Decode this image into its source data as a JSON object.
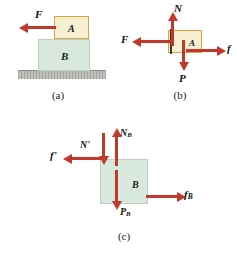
{
  "figure": {
    "background_color": "#ffffff",
    "arrow_color": "#c0392b",
    "block_a_fill": "#f6efd2",
    "block_a_border": "#d9a441",
    "block_b_fill": "#d8e8dc",
    "block_b_border": "#b9cfc0",
    "ground_color": "#b4b4b0"
  },
  "panels": [
    {
      "id": "a",
      "caption": "(a)",
      "blocks": [
        {
          "name": "block-a",
          "label": "A"
        },
        {
          "name": "block-b",
          "label": "B"
        }
      ],
      "forces": [
        {
          "name": "force-F",
          "label": "F",
          "direction": "left"
        }
      ],
      "ground": {
        "name": "ground-surface",
        "label": ""
      }
    },
    {
      "id": "b",
      "caption": "(b)",
      "blocks": [
        {
          "name": "block-a",
          "label": "A"
        }
      ],
      "forces": [
        {
          "name": "force-N",
          "label": "N",
          "direction": "up"
        },
        {
          "name": "force-P",
          "label": "P",
          "direction": "down"
        },
        {
          "name": "force-F",
          "label": "F",
          "direction": "left"
        },
        {
          "name": "force-f",
          "label": "f",
          "direction": "right"
        }
      ]
    },
    {
      "id": "c",
      "caption": "(c)",
      "blocks": [
        {
          "name": "block-b",
          "label": "B"
        }
      ],
      "forces": [
        {
          "name": "force-N-prime",
          "label": "N'",
          "direction": "down"
        },
        {
          "name": "force-N-B",
          "label": "N",
          "sub": "B",
          "direction": "up"
        },
        {
          "name": "force-P-B",
          "label": "P",
          "sub": "B",
          "direction": "down"
        },
        {
          "name": "force-f-prime",
          "label": "f'",
          "direction": "left"
        },
        {
          "name": "force-f-B",
          "label": "f",
          "sub": "B",
          "direction": "right"
        }
      ]
    }
  ]
}
